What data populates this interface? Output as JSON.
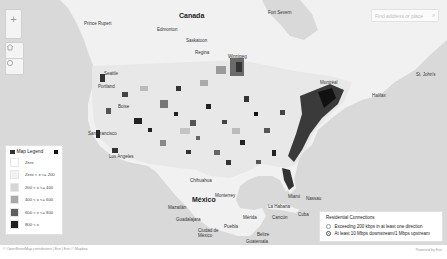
{
  "map": {
    "country_labels": [
      {
        "name": "Canada",
        "x": 179,
        "y": 12
      },
      {
        "name": "México",
        "x": 192,
        "y": 198
      }
    ],
    "city_labels": [
      {
        "name": "Prince Rupert",
        "x": 84,
        "y": 21
      },
      {
        "name": "Edmonton",
        "x": 157,
        "y": 27
      },
      {
        "name": "Saskatoon",
        "x": 186,
        "y": 38
      },
      {
        "name": "Regina",
        "x": 195,
        "y": 50
      },
      {
        "name": "Winnipeg",
        "x": 228,
        "y": 54
      },
      {
        "name": "Fort Severn",
        "x": 268,
        "y": 10
      },
      {
        "name": "Montréal",
        "x": 320,
        "y": 80
      },
      {
        "name": "Halifax",
        "x": 372,
        "y": 93
      },
      {
        "name": "St. John's",
        "x": 416,
        "y": 72
      },
      {
        "name": "Seattle",
        "x": 104,
        "y": 71
      },
      {
        "name": "Portland",
        "x": 98,
        "y": 84
      },
      {
        "name": "Boise",
        "x": 118,
        "y": 104
      },
      {
        "name": "San Francisco",
        "x": 88,
        "y": 131
      },
      {
        "name": "Los Angeles",
        "x": 109,
        "y": 154
      },
      {
        "name": "Chihuahua",
        "x": 190,
        "y": 178
      },
      {
        "name": "Monterrey",
        "x": 215,
        "y": 193
      },
      {
        "name": "Mazatlán",
        "x": 168,
        "y": 205
      },
      {
        "name": "Guadalajara",
        "x": 176,
        "y": 217
      },
      {
        "name": "Ciudad de México",
        "x": 198,
        "y": 228
      },
      {
        "name": "Puebla",
        "x": 224,
        "y": 224
      },
      {
        "name": "Mérida",
        "x": 243,
        "y": 215
      },
      {
        "name": "Cancún",
        "x": 272,
        "y": 215
      },
      {
        "name": "La Habana",
        "x": 268,
        "y": 204
      },
      {
        "name": "Miami",
        "x": 288,
        "y": 194
      },
      {
        "name": "Nassau",
        "x": 306,
        "y": 196
      },
      {
        "name": "Cuba",
        "x": 298,
        "y": 212
      },
      {
        "name": "Belize",
        "x": 257,
        "y": 232
      },
      {
        "name": "Guatemala",
        "x": 246,
        "y": 239
      }
    ],
    "zoom_in_label": "+",
    "home_icon": "home-icon",
    "locate_icon": "locate-icon"
  },
  "search": {
    "placeholder": "Find address or place",
    "icon": "search-icon"
  },
  "legend": {
    "title": "Map Legend",
    "items": [
      {
        "label": "Zero",
        "color": "#ffffff"
      },
      {
        "label": "Zero < x <= 200",
        "color": "#f2f2f2"
      },
      {
        "label": "200 < x <= 400",
        "color": "#d6d6d6"
      },
      {
        "label": "400 < x <= 600",
        "color": "#a8a8a8"
      },
      {
        "label": "600 < x <= 800",
        "color": "#5e5e5e"
      },
      {
        "label": "800 < x",
        "color": "#1e1e1e"
      }
    ]
  },
  "residential": {
    "title": "Residential Connections",
    "options": [
      {
        "label": "Exceeding 200 kbps in at least one direction",
        "selected": false
      },
      {
        "label": "At least 10 Mbps downstream/1 Mbps upstream",
        "selected": true
      }
    ]
  },
  "footer": {
    "attribution": "© OpenStreetMap contributors | Esri | Esri © Mapbox",
    "scale": "Esri",
    "powered_by": "Powered by Esri"
  }
}
